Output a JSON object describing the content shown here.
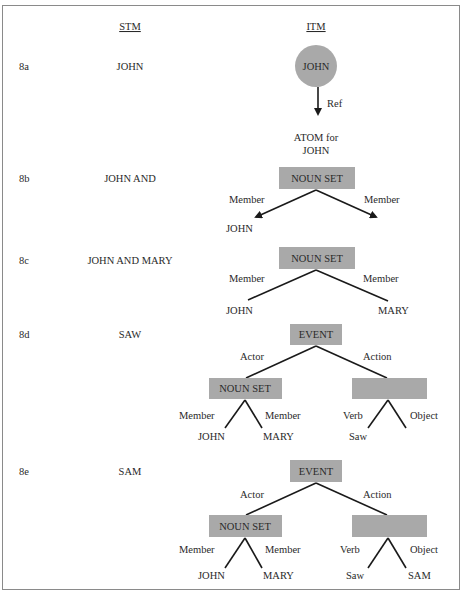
{
  "headers": {
    "stm": "STM",
    "itm": "ITM"
  },
  "colors": {
    "node_fill": "#a9a9a9",
    "edge": "#1a1a1a",
    "frame": "#8a8a8a"
  },
  "rows": [
    {
      "id": "8a",
      "label": "8a",
      "stm": "JOHN",
      "itm": {
        "circle_node": "JOHN",
        "edge_label": "Ref",
        "target_line1": "ATOM for",
        "target_line2": "JOHN"
      }
    },
    {
      "id": "8b",
      "label": "8b",
      "stm": "JOHN AND",
      "itm": {
        "root": "NOUN SET",
        "left_edge": "Member",
        "right_edge": "Member",
        "left_leaf": "JOHN",
        "right_leaf": ""
      }
    },
    {
      "id": "8c",
      "label": "8c",
      "stm": "JOHN AND MARY",
      "itm": {
        "root": "NOUN SET",
        "left_edge": "Member",
        "right_edge": "Member",
        "left_leaf": "JOHN",
        "right_leaf": "MARY"
      }
    },
    {
      "id": "8d",
      "label": "8d",
      "stm": "SAW",
      "itm": {
        "root": "EVENT",
        "left_edge": "Actor",
        "right_edge": "Action",
        "left_child": {
          "node": "NOUN SET",
          "left_edge": "Member",
          "right_edge": "Member",
          "left_leaf": "JOHN",
          "right_leaf": "MARY"
        },
        "right_child": {
          "node": "",
          "left_edge": "Verb",
          "right_edge": "Object",
          "left_leaf": "Saw",
          "right_leaf": ""
        }
      }
    },
    {
      "id": "8e",
      "label": "8e",
      "stm": "SAM",
      "itm": {
        "root": "EVENT",
        "left_edge": "Actor",
        "right_edge": "Action",
        "left_child": {
          "node": "NOUN SET",
          "left_edge": "Member",
          "right_edge": "Member",
          "left_leaf": "JOHN",
          "right_leaf": "MARY"
        },
        "right_child": {
          "node": "",
          "left_edge": "Verb",
          "right_edge": "Object",
          "left_leaf": "Saw",
          "right_leaf": "SAM"
        }
      }
    }
  ]
}
